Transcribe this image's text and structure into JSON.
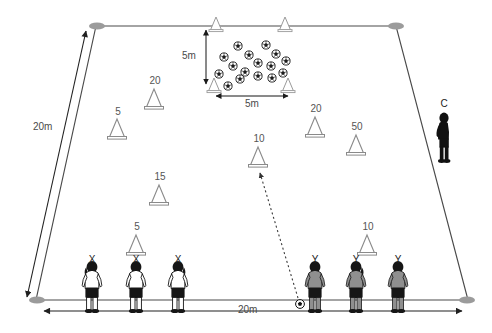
{
  "diagram": {
    "field": {
      "shape": "trapezoid",
      "top_left": [
        96,
        26
      ],
      "top_right": [
        396,
        26
      ],
      "bottom_right": [
        468,
        300
      ],
      "bottom_left": [
        36,
        300
      ],
      "line_color": "#000000"
    },
    "dimensions": [
      {
        "name": "field-height",
        "label": "20m",
        "x": 33,
        "y": 122,
        "orientation": "vertical-left"
      },
      {
        "name": "field-width",
        "label": "20m",
        "x": 238,
        "y": 305,
        "orientation": "horizontal-bottom"
      },
      {
        "name": "grid-height",
        "label": "5m",
        "x": 182,
        "y": 51,
        "orientation": "vertical-grid"
      },
      {
        "name": "grid-width",
        "label": "5m",
        "x": 245,
        "y": 97,
        "orientation": "horizontal-grid"
      }
    ],
    "corner_markers": [
      {
        "name": "corner-marker-top-left",
        "x": 97,
        "y": 26
      },
      {
        "name": "corner-marker-top-right",
        "x": 396,
        "y": 26
      },
      {
        "name": "corner-marker-bottom-left",
        "x": 37,
        "y": 300
      },
      {
        "name": "corner-marker-bottom-right",
        "x": 467,
        "y": 300
      }
    ],
    "ball_grid": {
      "name": "ball-cluster",
      "ball_count": 16,
      "balls": [
        {
          "x": 238,
          "y": 46
        },
        {
          "x": 266,
          "y": 45
        },
        {
          "x": 224,
          "y": 57
        },
        {
          "x": 249,
          "y": 55
        },
        {
          "x": 276,
          "y": 54
        },
        {
          "x": 233,
          "y": 66
        },
        {
          "x": 258,
          "y": 63
        },
        {
          "x": 271,
          "y": 66
        },
        {
          "x": 245,
          "y": 72
        },
        {
          "x": 286,
          "y": 61
        },
        {
          "x": 219,
          "y": 74
        },
        {
          "x": 240,
          "y": 79
        },
        {
          "x": 258,
          "y": 76
        },
        {
          "x": 272,
          "y": 78
        },
        {
          "x": 283,
          "y": 73
        },
        {
          "x": 228,
          "y": 86
        }
      ],
      "corner_cones": [
        {
          "name": "grid-cone-top-left",
          "x": 216,
          "y": 25
        },
        {
          "name": "grid-cone-top-right",
          "x": 285,
          "y": 25
        },
        {
          "name": "grid-cone-bottom-left",
          "x": 214,
          "y": 88
        },
        {
          "name": "grid-cone-bottom-right",
          "x": 288,
          "y": 88
        }
      ]
    },
    "cones": [
      {
        "name": "cone-20-upper-left",
        "label": "20",
        "x": 154,
        "y": 94,
        "size": "large"
      },
      {
        "name": "cone-5-left",
        "label": "5",
        "x": 117,
        "y": 124,
        "size": "large"
      },
      {
        "name": "cone-20-upper-right",
        "label": "20",
        "x": 315,
        "y": 122,
        "size": "large"
      },
      {
        "name": "cone-50-right",
        "label": "50",
        "x": 356,
        "y": 140,
        "size": "large"
      },
      {
        "name": "cone-10-center",
        "label": "10",
        "x": 258,
        "y": 152,
        "size": "large"
      },
      {
        "name": "cone-15-left",
        "label": "15",
        "x": 159,
        "y": 190,
        "size": "large"
      },
      {
        "name": "cone-5-lower-left",
        "label": "5",
        "x": 136,
        "y": 240,
        "size": "large"
      },
      {
        "name": "cone-10-lower-right",
        "label": "10",
        "x": 367,
        "y": 240,
        "size": "large"
      }
    ],
    "players": [
      {
        "name": "player-x-1",
        "label": "X",
        "x": 92,
        "y": 288,
        "team": "X",
        "shirt": "#ffffff",
        "shorts": "#151515",
        "facing": "away"
      },
      {
        "name": "player-x-2",
        "label": "X",
        "x": 136,
        "y": 288,
        "team": "X",
        "shirt": "#ffffff",
        "shorts": "#151515",
        "facing": "away"
      },
      {
        "name": "player-x-3",
        "label": "X",
        "x": 178,
        "y": 288,
        "team": "X",
        "shirt": "#ffffff",
        "shorts": "#151515",
        "facing": "away"
      },
      {
        "name": "player-y-1",
        "label": "Y",
        "x": 315,
        "y": 288,
        "team": "Y",
        "shirt": "#8f8f8f",
        "shorts": "#151515",
        "facing": "away"
      },
      {
        "name": "player-y-2",
        "label": "Y",
        "x": 356,
        "y": 288,
        "team": "Y",
        "shirt": "#8f8f8f",
        "shorts": "#151515",
        "facing": "away"
      },
      {
        "name": "player-y-3",
        "label": "Y",
        "x": 398,
        "y": 288,
        "team": "Y",
        "shirt": "#8f8f8f",
        "shorts": "#151515",
        "facing": "away"
      }
    ],
    "coach": {
      "name": "coach-figure",
      "label": "C",
      "x": 444,
      "y": 140,
      "color": "#101010"
    },
    "loose_ball": {
      "name": "loose-ball",
      "x": 300,
      "y": 305
    },
    "movement_arrow": {
      "name": "pass-direction-arrow",
      "style": "dotted",
      "from": [
        298,
        300
      ],
      "to": [
        259,
        172
      ]
    }
  }
}
